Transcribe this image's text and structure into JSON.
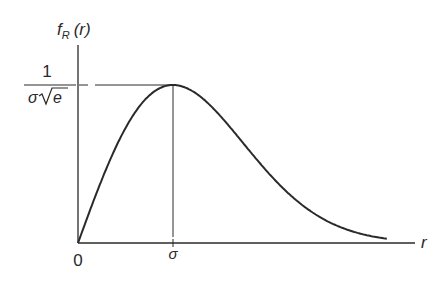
{
  "chart_data": {
    "type": "line",
    "title": "",
    "function": "Rayleigh probability density f_R(r) = (r/σ²)·exp(−r²/(2σ²))",
    "xlabel": "r",
    "ylabel": "f_R (r)",
    "x_ticks": [
      {
        "value": 0,
        "label": "0"
      },
      {
        "value": 1,
        "label": "σ"
      }
    ],
    "y_ticks": [
      {
        "value": 0.6065,
        "label_numerator": "1",
        "label_denominator": "σ√e"
      }
    ],
    "peak": {
      "x": 1,
      "y": 0.6065
    },
    "x_range": [
      0,
      3.25
    ],
    "grid": false,
    "legend": null,
    "annotations": [
      "dashed horizontal guide at peak height",
      "vertical guide at r = σ"
    ]
  },
  "labels": {
    "y_axis_f": "f",
    "y_axis_sub": "R",
    "y_axis_arg": "(r)",
    "x_axis": "r",
    "origin": "0",
    "sigma_tick": "σ",
    "peak_numerator": "1",
    "peak_denom_sigma": "σ",
    "peak_denom_e": "e"
  },
  "colors": {
    "ink": "#2a2a2a",
    "background": "#ffffff"
  }
}
